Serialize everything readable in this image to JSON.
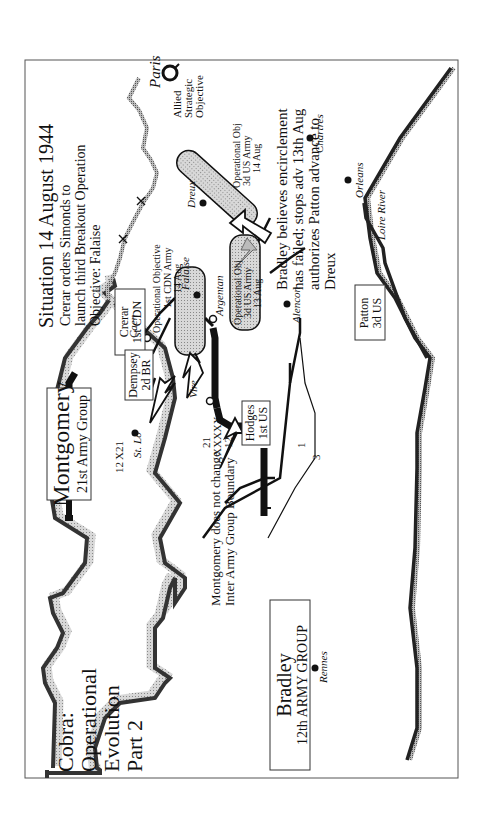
{
  "title": {
    "line1": "Cobra:",
    "line2": "Operational",
    "line3": "Evolution",
    "line4": "Part 2"
  },
  "situation": {
    "heading": "Situation 14 August 1944",
    "line1": "Crerar orders Simonds to",
    "line2": "launch third Breakout Operation",
    "line3": "Objective:  Falaise"
  },
  "strategic": {
    "city": "Paris",
    "line1": "Allied",
    "line2": "Strategic",
    "line3": "Objective"
  },
  "commands": {
    "montgomery": {
      "name": "Montgomery",
      "unit": "21st Army Group"
    },
    "bradley": {
      "name": "Bradley",
      "unit": "12th ARMY GROUP"
    },
    "crerar": {
      "name": "Crerar",
      "unit": "1st CDN"
    },
    "dempsey": {
      "name": "Dempsey",
      "unit": "2d BR"
    },
    "hodges": {
      "name": "Hodges",
      "unit": "1st US"
    },
    "patton": {
      "name": "Patton",
      "unit": "3d US"
    }
  },
  "objectives": {
    "cdn": {
      "line1": "Operational Objective",
      "line2": "1st CDN Army",
      "line3": "14 Aug"
    },
    "us13": {
      "line1": "Operational Obj",
      "line2": "3d US Army",
      "line3": "13 Aug"
    },
    "us14": {
      "line1": "Operational Obj",
      "line2": "3d US Army",
      "line3": "14 Aug"
    }
  },
  "cities": {
    "caen": "Caen",
    "falaise": "Falaise",
    "argentan": "Argentan",
    "alencon": "Alencon",
    "vire": "Vire",
    "stlo": "St. Lo",
    "rennes": "Rennes",
    "dreux": "Dreux",
    "chartres": "Chartres",
    "orleans": "Orleans"
  },
  "river": {
    "loire": "Loire River"
  },
  "boundaries": {
    "army_group": {
      "top": "21",
      "mid": "XXXXX",
      "bottom": "12"
    },
    "coast": {
      "left": "12",
      "mid": "X",
      "right": "21"
    },
    "corps": {
      "a": "1",
      "b": "3"
    }
  },
  "notes": {
    "montgomery": {
      "line1": "Montgomery does not change",
      "line2": "Inter Army Group Boundary"
    },
    "bradley": {
      "line1": "Bradley believes encirclement",
      "line2": "has failed; stops adv 13th Aug",
      "line3": "authorizes Patton advance to",
      "line4": "Dreux"
    }
  },
  "colors": {
    "ink": "#111111",
    "shade": "#c8c8c8",
    "frame": "#555555"
  }
}
